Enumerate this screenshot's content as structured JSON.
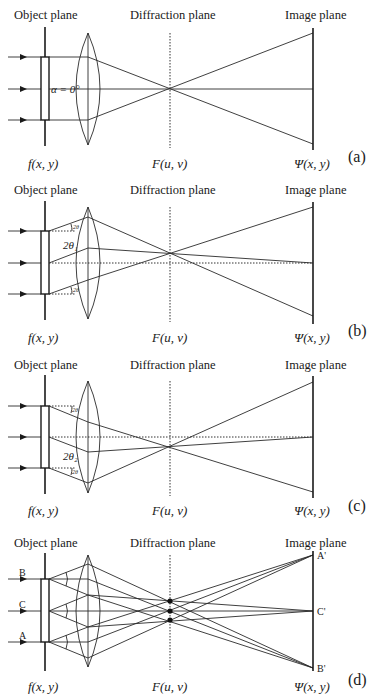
{
  "panels": [
    {
      "id": "a",
      "tag": "(a)",
      "object_plane_label": "Object plane",
      "diffraction_plane_label": "Diffraction plane",
      "image_plane_label": "Image plane",
      "object_function": "f(x, y)",
      "diffraction_function": "F(u, v)",
      "image_function": "Ψ(x, y)",
      "annotation": "α = 0°",
      "illumination": "axial"
    },
    {
      "id": "b",
      "tag": "(b)",
      "object_plane_label": "Object plane",
      "diffraction_plane_label": "Diffraction plane",
      "image_plane_label": "Image plane",
      "object_function": "f(x, y)",
      "diffraction_function": "F(u, v)",
      "image_function": "Ψ(x, y)",
      "annotation": "2θ₁",
      "small_angle_label": "2θ",
      "illumination": "tilted-up"
    },
    {
      "id": "c",
      "tag": "(c)",
      "object_plane_label": "Object plane",
      "diffraction_plane_label": "Diffraction plane",
      "image_plane_label": "Image plane",
      "object_function": "f(x, y)",
      "diffraction_function": "F(u, v)",
      "image_function": "Ψ(x, y)",
      "annotation": "2θ₂",
      "small_angle_label": "2θ",
      "illumination": "tilted-down"
    },
    {
      "id": "d",
      "tag": "(d)",
      "object_plane_label": "Object plane",
      "diffraction_plane_label": "Diffraction plane",
      "image_plane_label": "Image plane",
      "object_function": "f(x, y)",
      "diffraction_function": "F(u, v)",
      "image_function": "Ψ(x, y)",
      "object_points": [
        "B",
        "C",
        "A"
      ],
      "image_points": [
        "A'",
        "C'",
        "B'"
      ],
      "illumination": "cone"
    }
  ]
}
